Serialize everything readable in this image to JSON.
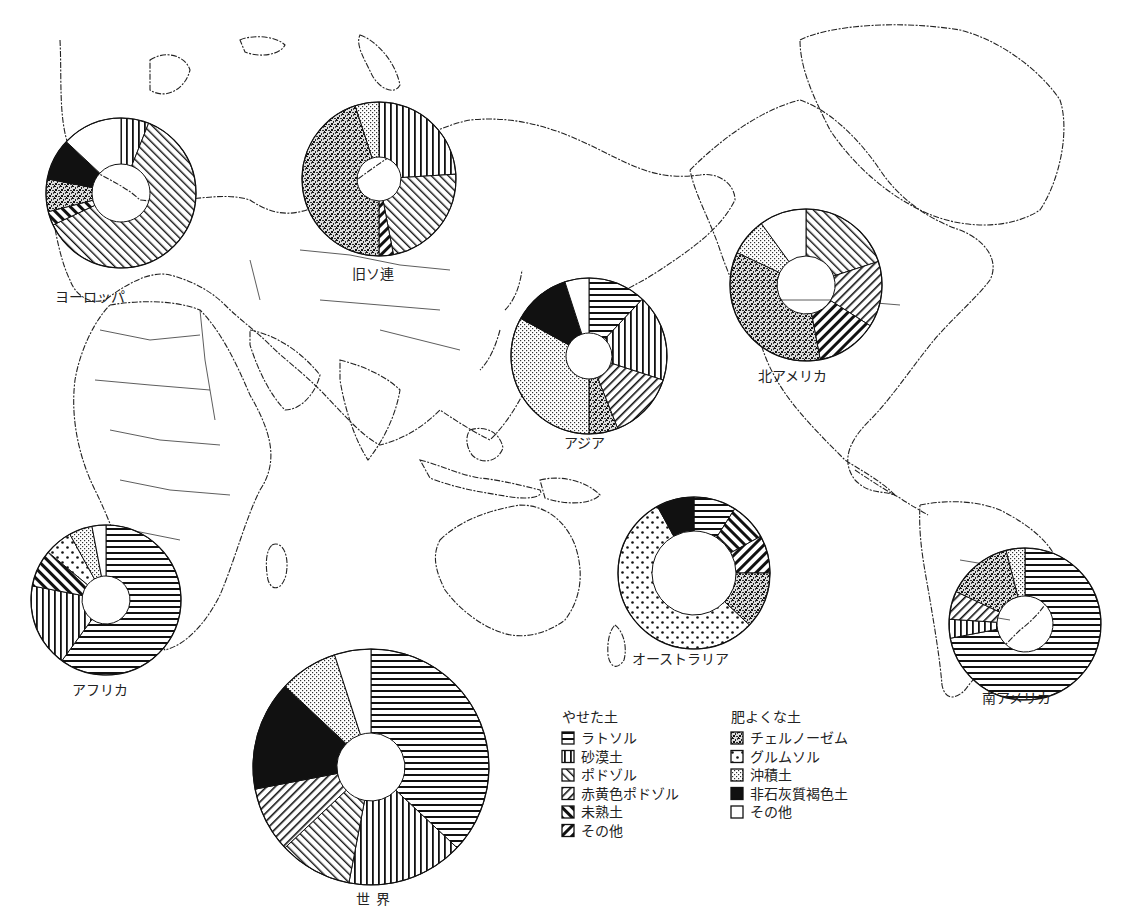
{
  "chart_data": {
    "type": "pie",
    "variant": "donut",
    "title": "",
    "legend": {
      "groups": [
        {
          "title": "やせた土",
          "items": [
            {
              "key": "laterite",
              "label": "ラトソル",
              "pattern": "horizontal-lines"
            },
            {
              "key": "desert",
              "label": "砂漠土",
              "pattern": "vertical-lines"
            },
            {
              "key": "podzol",
              "label": "ポドゾル",
              "pattern": "diagonal-right-thin"
            },
            {
              "key": "redyellow",
              "label": "赤黄色ポドゾル",
              "pattern": "diagonal-left-thin"
            },
            {
              "key": "immature",
              "label": "未熟土",
              "pattern": "diagonal-right-thick"
            },
            {
              "key": "poor_other",
              "label": "その他",
              "pattern": "diagonal-left-thick"
            }
          ]
        },
        {
          "title": "肥よくな土",
          "items": [
            {
              "key": "chernozem",
              "label": "チェルノーゼム",
              "pattern": "dense-stipple"
            },
            {
              "key": "grumusol",
              "label": "グルムソル",
              "pattern": "large-dots"
            },
            {
              "key": "alluvial",
              "label": "沖積土",
              "pattern": "fine-dots"
            },
            {
              "key": "brown",
              "label": "非石灰質褐色土",
              "pattern": "solid-black"
            },
            {
              "key": "rich_other",
              "label": "その他",
              "pattern": "blank"
            }
          ]
        }
      ]
    },
    "regions": [
      {
        "name": "ヨーロッパ",
        "unit": "%",
        "slices": [
          {
            "key": "desert",
            "value": 6
          },
          {
            "key": "podzol",
            "value": 62
          },
          {
            "key": "immature",
            "value": 3
          },
          {
            "key": "chernozem",
            "value": 7
          },
          {
            "key": "brown",
            "value": 9
          },
          {
            "key": "rich_other",
            "value": 13
          }
        ]
      },
      {
        "name": "旧ソ連",
        "unit": "%",
        "slices": [
          {
            "key": "desert",
            "value": 24
          },
          {
            "key": "podzol",
            "value": 23
          },
          {
            "key": "poor_other",
            "value": 3
          },
          {
            "key": "chernozem",
            "value": 45
          },
          {
            "key": "alluvial",
            "value": 5
          }
        ]
      },
      {
        "name": "アジア",
        "unit": "%",
        "slices": [
          {
            "key": "laterite",
            "value": 12
          },
          {
            "key": "desert",
            "value": 18
          },
          {
            "key": "redyellow",
            "value": 14
          },
          {
            "key": "chernozem",
            "value": 6
          },
          {
            "key": "alluvial",
            "value": 33
          },
          {
            "key": "brown",
            "value": 12
          },
          {
            "key": "rich_other",
            "value": 5
          }
        ]
      },
      {
        "name": "北アメリカ",
        "unit": "%",
        "slices": [
          {
            "key": "podzol",
            "value": 20
          },
          {
            "key": "redyellow",
            "value": 14
          },
          {
            "key": "poor_other",
            "value": 13
          },
          {
            "key": "chernozem",
            "value": 35
          },
          {
            "key": "alluvial",
            "value": 8
          },
          {
            "key": "rich_other",
            "value": 10
          }
        ]
      },
      {
        "name": "オーストラリア",
        "unit": "%",
        "slices": [
          {
            "key": "laterite",
            "value": 9
          },
          {
            "key": "immature",
            "value": 8
          },
          {
            "key": "poor_other",
            "value": 8
          },
          {
            "key": "chernozem",
            "value": 12
          },
          {
            "key": "grumusol",
            "value": 55
          },
          {
            "key": "brown",
            "value": 8
          }
        ]
      },
      {
        "name": "南アメリカ",
        "unit": "%",
        "slices": [
          {
            "key": "laterite",
            "value": 72
          },
          {
            "key": "desert",
            "value": 4
          },
          {
            "key": "redyellow",
            "value": 6
          },
          {
            "key": "chernozem",
            "value": 14
          },
          {
            "key": "alluvial",
            "value": 4
          }
        ]
      },
      {
        "name": "アフリカ",
        "unit": "%",
        "slices": [
          {
            "key": "laterite",
            "value": 60
          },
          {
            "key": "desert",
            "value": 18
          },
          {
            "key": "immature",
            "value": 8
          },
          {
            "key": "grumusol",
            "value": 6
          },
          {
            "key": "alluvial",
            "value": 5
          },
          {
            "key": "rich_other",
            "value": 3
          }
        ]
      },
      {
        "name": "世界",
        "unit": "%",
        "slices": [
          {
            "key": "laterite",
            "value": 37
          },
          {
            "key": "desert",
            "value": 16
          },
          {
            "key": "podzol",
            "value": 10
          },
          {
            "key": "redyellow",
            "value": 9
          },
          {
            "key": "brown",
            "value": 15
          },
          {
            "key": "alluvial",
            "value": 8
          },
          {
            "key": "rich_other",
            "value": 5
          }
        ]
      }
    ]
  }
}
